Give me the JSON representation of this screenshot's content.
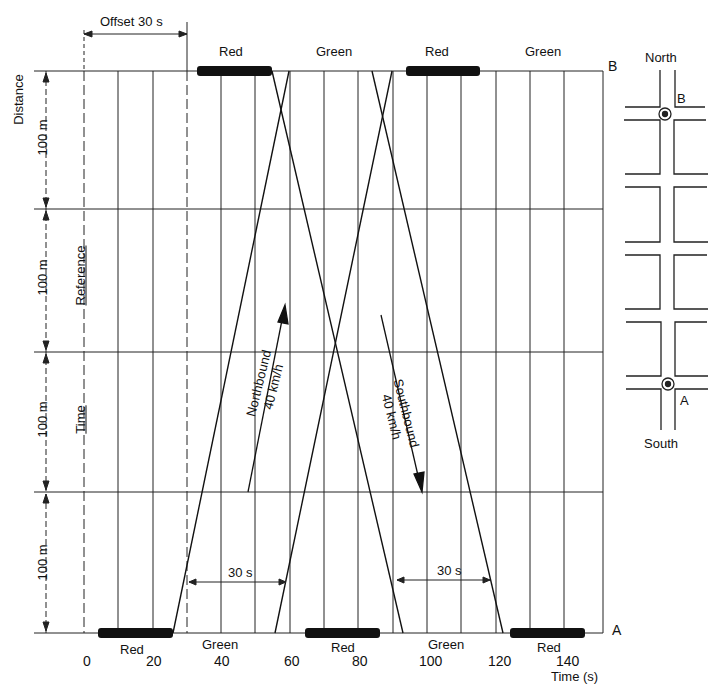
{
  "diagram": {
    "offset_label": "Offset 30 s",
    "x_axis": {
      "label": "Time (s)",
      "ticks": [
        "0",
        "20",
        "40",
        "60",
        "80",
        "100",
        "120",
        "140"
      ]
    },
    "y_axis": {
      "label": "Distance",
      "segments": [
        "100 m",
        "100 m",
        "100 m",
        "100 m"
      ]
    },
    "reference_label": "Reference",
    "time_label": "Time",
    "top_signal": {
      "name": "B",
      "phases": [
        {
          "label": "Red",
          "start": 30,
          "end": 52
        },
        {
          "label": "Green",
          "start": 52,
          "end": 90
        },
        {
          "label": "Red",
          "start": 90,
          "end": 112
        },
        {
          "label": "Green",
          "start": 112,
          "end": 150
        }
      ]
    },
    "bottom_signal": {
      "name": "A",
      "phases": [
        {
          "label": "Red",
          "start": 0,
          "end": 22
        },
        {
          "label": "Green",
          "start": 22,
          "end": 60
        },
        {
          "label": "Red",
          "start": 60,
          "end": 82
        },
        {
          "label": "Green",
          "start": 82,
          "end": 120
        },
        {
          "label": "Red",
          "start": 120,
          "end": 142
        }
      ]
    },
    "bands": {
      "northbound": {
        "label": "Northbound",
        "speed": "40 km/h",
        "bandwidth": "30 s"
      },
      "southbound": {
        "label": "Southbound",
        "speed": "40 km/h",
        "bandwidth": "30 s"
      }
    },
    "map": {
      "north_label": "North",
      "south_label": "South",
      "intersection_b": "B",
      "intersection_a": "A"
    }
  }
}
